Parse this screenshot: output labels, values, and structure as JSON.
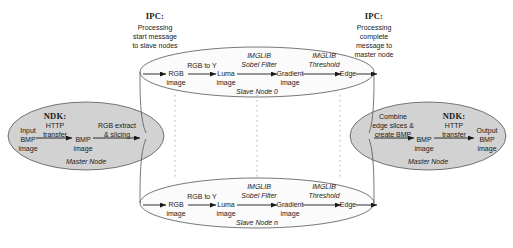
{
  "diagram": {
    "colors": {
      "master_fill": "#d2d2d2",
      "slave_fill": "#fbfbfb",
      "stroke": "#555555",
      "text": "#1a1a1a",
      "dotted": "#9a9a9a"
    }
  },
  "ipc_left": {
    "title": "IPC:",
    "line1": "Processing",
    "line2": "start message",
    "line3": "to slave nodes"
  },
  "ipc_right": {
    "title": "IPC:",
    "line1": "Processing",
    "line2": "complete",
    "line3": "message to",
    "line4": "master node"
  },
  "master_in": {
    "node_name": "Master Node",
    "ndk_title": "NDK:",
    "ndk_line1": "HTTP",
    "ndk_line2": "transfer",
    "input_line1": "Input",
    "input_line2": "BMP",
    "input_line3": "image",
    "mid_line1": "BMP",
    "mid_line2": "image",
    "op_line1": "RGB extract",
    "op_line2": "& slicing"
  },
  "master_out": {
    "node_name": "Master Node",
    "op_line1": "Combine",
    "op_line2": "edge slices &",
    "op_line3": "create BMP",
    "mid_line1": "BMP",
    "mid_line2": "image",
    "ndk_title": "NDK:",
    "ndk_line1": "HTTP",
    "ndk_line2": "transfer",
    "out_line1": "Output",
    "out_line2": "BMP",
    "out_line3": "image"
  },
  "slave_nodes": [
    {
      "node_name": "Slave Node 0",
      "d1_line1": "RGB",
      "d1_line2": "image",
      "op1": "RGB to Y",
      "d2_line1": "Luma",
      "d2_line2": "image",
      "op2_line1": "IMGLIB",
      "op2_line2": "Sobel Filter",
      "d3_line1": "Gradient",
      "d3_line2": "image",
      "op3_line1": "IMGLIB",
      "op3_line2": "Threshold",
      "d4": "Edge"
    },
    {
      "node_name": "Slave Node n",
      "d1_line1": "RGB",
      "d1_line2": "image",
      "op1": "RGB to Y",
      "d2_line1": "Luma",
      "d2_line2": "image",
      "op2_line1": "IMGLIB",
      "op2_line2": "Sobel Filter",
      "d3_line1": "Gradient",
      "d3_line2": "image",
      "op3_line1": "IMGLIB",
      "op3_line2": "Threshold",
      "d4": "Edge"
    }
  ]
}
